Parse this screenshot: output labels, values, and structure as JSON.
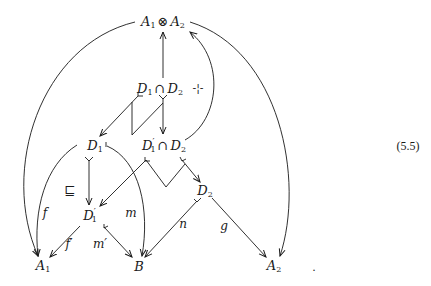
{
  "diagram": {
    "equation_number": "(5.5)",
    "trailing_mark": ".",
    "nodes": {
      "tensor": {
        "left": "A",
        "left_sub": "1",
        "op": "⊗",
        "right": "A",
        "right_sub": "2"
      },
      "meet_top": {
        "left": "D",
        "left_sub": "1",
        "op": "∩",
        "right": "D",
        "right_sub": "2"
      },
      "pullback_mark": "-¦-",
      "d1": {
        "base": "D",
        "sub": "1"
      },
      "meet_mid": {
        "left": "D",
        "left_sub": "1",
        "left_prime": "′",
        "op": "∩",
        "right": "D",
        "right_sub": "2"
      },
      "d2": {
        "base": "D",
        "sub": "2"
      },
      "d1p": {
        "base": "D",
        "sub": "1",
        "prime": "′"
      },
      "a1": {
        "base": "A",
        "sub": "1"
      },
      "b": {
        "base": "B"
      },
      "a2": {
        "base": "A",
        "sub": "2"
      }
    },
    "labels": {
      "f": "f",
      "f_prime": "f′",
      "m": "m",
      "m_prime": "m′",
      "n": "n",
      "g": "g",
      "sqsubseteq": "⊑"
    },
    "edges": [
      {
        "from": "D1∩D2",
        "to": "A1⊗A2",
        "type": "arrow"
      },
      {
        "from": "D1∩D2",
        "to": "D1",
        "type": "mono"
      },
      {
        "from": "D1∩D2",
        "to": "D1'∩D2",
        "type": "mono"
      },
      {
        "from": "D1'∩D2",
        "to": "A1⊗A2",
        "type": "arrow-curved"
      },
      {
        "from": "A1⊗A2",
        "to": "A1",
        "type": "arrow-curved"
      },
      {
        "from": "A1⊗A2",
        "to": "A2",
        "type": "arrow-curved"
      },
      {
        "from": "D1",
        "to": "A1",
        "label": "f",
        "type": "arrow-curved"
      },
      {
        "from": "D1",
        "to": "D1'",
        "type": "mono"
      },
      {
        "from": "D1",
        "to": "B",
        "label": "m",
        "type": "mono-curved"
      },
      {
        "from": "D1'∩D2",
        "to": "D1'",
        "type": "mono"
      },
      {
        "from": "D1'∩D2",
        "to": "D2",
        "type": "mono"
      },
      {
        "from": "D1'",
        "to": "A1",
        "label": "f'",
        "type": "arrow"
      },
      {
        "from": "D1'",
        "to": "B",
        "label": "m'",
        "type": "mono"
      },
      {
        "from": "D2",
        "to": "B",
        "label": "n",
        "type": "mono"
      },
      {
        "from": "D2",
        "to": "A2",
        "label": "g",
        "type": "arrow"
      }
    ]
  }
}
